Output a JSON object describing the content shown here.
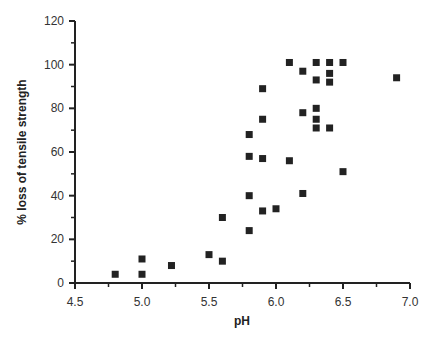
{
  "chart_data": {
    "type": "scatter",
    "title": "",
    "xlabel": "pH",
    "ylabel": "% loss of tensile strength",
    "xlim": [
      4.5,
      7.0
    ],
    "ylim": [
      0,
      120
    ],
    "xticks": [
      "4.5",
      "5.0",
      "5.5",
      "6.0",
      "6.5",
      "7.0"
    ],
    "yticks": [
      "0",
      "20",
      "40",
      "60",
      "80",
      "100",
      "120"
    ],
    "grid": false,
    "legend": null,
    "marker": "square",
    "series": [
      {
        "name": "samples",
        "points": [
          {
            "x": 4.8,
            "y": 4
          },
          {
            "x": 5.0,
            "y": 11
          },
          {
            "x": 5.0,
            "y": 4
          },
          {
            "x": 5.22,
            "y": 8
          },
          {
            "x": 5.5,
            "y": 13
          },
          {
            "x": 5.6,
            "y": 10
          },
          {
            "x": 5.6,
            "y": 30
          },
          {
            "x": 5.8,
            "y": 24
          },
          {
            "x": 5.8,
            "y": 40
          },
          {
            "x": 5.8,
            "y": 58
          },
          {
            "x": 5.8,
            "y": 68
          },
          {
            "x": 5.9,
            "y": 33
          },
          {
            "x": 5.9,
            "y": 57
          },
          {
            "x": 5.9,
            "y": 75
          },
          {
            "x": 5.9,
            "y": 89
          },
          {
            "x": 6.0,
            "y": 34
          },
          {
            "x": 6.1,
            "y": 56
          },
          {
            "x": 6.1,
            "y": 101
          },
          {
            "x": 6.2,
            "y": 41
          },
          {
            "x": 6.2,
            "y": 78
          },
          {
            "x": 6.2,
            "y": 97
          },
          {
            "x": 6.3,
            "y": 71
          },
          {
            "x": 6.3,
            "y": 75
          },
          {
            "x": 6.3,
            "y": 80
          },
          {
            "x": 6.3,
            "y": 93
          },
          {
            "x": 6.3,
            "y": 101
          },
          {
            "x": 6.4,
            "y": 71
          },
          {
            "x": 6.4,
            "y": 92
          },
          {
            "x": 6.4,
            "y": 96
          },
          {
            "x": 6.4,
            "y": 101
          },
          {
            "x": 6.5,
            "y": 51
          },
          {
            "x": 6.5,
            "y": 101
          },
          {
            "x": 6.9,
            "y": 94
          }
        ]
      }
    ]
  },
  "colors": {
    "marker": "#222222",
    "axis": "#222222"
  }
}
